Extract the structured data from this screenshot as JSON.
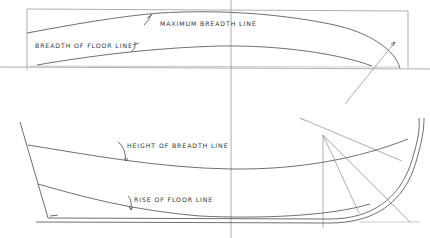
{
  "diagram": {
    "type": "ship-lines-drawing",
    "colors": {
      "background": "#ffffff",
      "line": "#4a4a4a",
      "label": "#333333"
    },
    "plan_view": {
      "labels": {
        "maximum_breadth_line": "MAXIMUM BREADTH LINE",
        "breadth_of_floor_line": "BREADTH OF FLOOR LINE"
      }
    },
    "profile_view": {
      "labels": {
        "height_of_breadth_line": "HEIGHT OF BREADTH LINE",
        "rise_of_floor_line": "RISE OF FLOOR LINE"
      }
    }
  }
}
